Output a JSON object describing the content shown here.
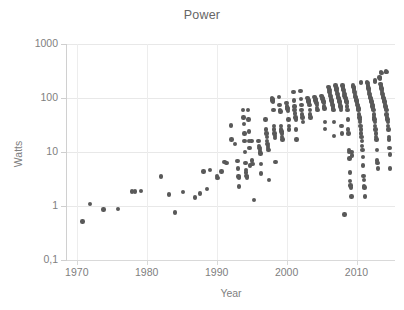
{
  "chart_data": {
    "type": "scatter",
    "title": "Power",
    "xlabel": "Year",
    "ylabel": "Watts",
    "xlim": [
      1968.6,
      2015.5
    ],
    "ylim": [
      0.1,
      1000
    ],
    "yscale": "log",
    "xticks": [
      1970,
      1980,
      1990,
      2000,
      2010
    ],
    "xticklabels": [
      "1970",
      "1980",
      "1990",
      "2000",
      "2010"
    ],
    "yticks": [
      0.1,
      1,
      10,
      100,
      1000
    ],
    "yticklabels": [
      "0,1",
      "1",
      "10",
      "100",
      "1000"
    ],
    "grid": "both",
    "legend": "none",
    "marker_color": "#595959",
    "marker_size_px": 4.4,
    "axis_color": "#d4d4d4",
    "grid_color": "#e8e8e8",
    "text_color": "#808080",
    "title_color": "#666666",
    "background": "#ffffff",
    "points": [
      [
        1970.8,
        0.52
      ],
      [
        1971.9,
        1.08
      ],
      [
        1973.8,
        0.87
      ],
      [
        1975.9,
        0.88
      ],
      [
        1977.9,
        1.85
      ],
      [
        1978.3,
        1.85
      ],
      [
        1979.2,
        1.9
      ],
      [
        1982.0,
        3.5
      ],
      [
        1983.2,
        1.65
      ],
      [
        1984.0,
        0.76
      ],
      [
        1985.2,
        1.8
      ],
      [
        1986.9,
        1.45
      ],
      [
        1987.6,
        1.7
      ],
      [
        1988.1,
        4.4
      ],
      [
        1988.6,
        2.05
      ],
      [
        1989.0,
        4.7
      ],
      [
        1990.0,
        3.6
      ],
      [
        1990.1,
        3.3
      ],
      [
        1990.7,
        4.4
      ],
      [
        1991.1,
        6.5
      ],
      [
        1991.4,
        6.3
      ],
      [
        1992.0,
        31
      ],
      [
        1992.1,
        17
      ],
      [
        1992.6,
        14
      ],
      [
        1993.0,
        6.9
      ],
      [
        1993.05,
        5.0
      ],
      [
        1993.1,
        3.5
      ],
      [
        1993.15,
        3.4
      ],
      [
        1993.2,
        2.3
      ],
      [
        1993.8,
        60
      ],
      [
        1993.85,
        44
      ],
      [
        1993.9,
        33
      ],
      [
        1993.95,
        22
      ],
      [
        1994.0,
        16
      ],
      [
        1994.05,
        10
      ],
      [
        1994.1,
        6.3
      ],
      [
        1994.15,
        4.6
      ],
      [
        1994.2,
        4.2
      ],
      [
        1994.25,
        3.6
      ],
      [
        1994.3,
        3.4
      ],
      [
        1994.5,
        60
      ],
      [
        1994.55,
        40
      ],
      [
        1994.6,
        24
      ],
      [
        1994.65,
        16
      ],
      [
        1994.7,
        12
      ],
      [
        1994.75,
        5.6
      ],
      [
        1995.0,
        16
      ],
      [
        1995.05,
        7.0
      ],
      [
        1995.1,
        6.0
      ],
      [
        1995.3,
        1.28
      ],
      [
        1996.0,
        16
      ],
      [
        1996.05,
        13
      ],
      [
        1996.1,
        12
      ],
      [
        1996.15,
        11
      ],
      [
        1996.2,
        10
      ],
      [
        1996.25,
        9.4
      ],
      [
        1996.3,
        6.0
      ],
      [
        1996.35,
        4.0
      ],
      [
        1997.0,
        40
      ],
      [
        1997.05,
        26
      ],
      [
        1997.1,
        22
      ],
      [
        1997.15,
        19
      ],
      [
        1997.2,
        16
      ],
      [
        1997.25,
        14
      ],
      [
        1997.3,
        13
      ],
      [
        1997.35,
        12
      ],
      [
        1997.4,
        11
      ],
      [
        1997.45,
        3.0
      ],
      [
        1997.9,
        100
      ],
      [
        1997.95,
        96
      ],
      [
        1998.0,
        90
      ],
      [
        1998.05,
        86
      ],
      [
        1998.1,
        60
      ],
      [
        1998.15,
        30
      ],
      [
        1998.2,
        26
      ],
      [
        1998.25,
        22
      ],
      [
        1998.3,
        20
      ],
      [
        1998.35,
        18
      ],
      [
        1998.4,
        6.5
      ],
      [
        1998.9,
        104
      ],
      [
        1999.0,
        74
      ],
      [
        1999.05,
        60
      ],
      [
        1999.1,
        56
      ],
      [
        1999.15,
        30
      ],
      [
        1999.2,
        26
      ],
      [
        1999.25,
        24
      ],
      [
        1999.3,
        22
      ],
      [
        1999.35,
        19
      ],
      [
        1999.4,
        17
      ],
      [
        2000.0,
        80
      ],
      [
        2000.05,
        70
      ],
      [
        2000.1,
        66
      ],
      [
        2000.15,
        62
      ],
      [
        2000.2,
        58
      ],
      [
        2000.25,
        40
      ],
      [
        2000.3,
        30
      ],
      [
        2000.35,
        26
      ],
      [
        2001.0,
        130
      ],
      [
        2001.05,
        90
      ],
      [
        2001.1,
        70
      ],
      [
        2001.15,
        60
      ],
      [
        2001.2,
        52
      ],
      [
        2001.25,
        44
      ],
      [
        2001.3,
        40
      ],
      [
        2001.35,
        26
      ],
      [
        2001.4,
        17
      ],
      [
        2002.0,
        134
      ],
      [
        2002.05,
        96
      ],
      [
        2002.1,
        74
      ],
      [
        2002.15,
        60
      ],
      [
        2002.2,
        50
      ],
      [
        2002.25,
        44
      ],
      [
        2002.3,
        36
      ],
      [
        2003.0,
        100
      ],
      [
        2003.05,
        96
      ],
      [
        2003.1,
        90
      ],
      [
        2003.15,
        86
      ],
      [
        2003.2,
        80
      ],
      [
        2003.25,
        74
      ],
      [
        2003.3,
        60
      ],
      [
        2003.35,
        50
      ],
      [
        2003.4,
        44
      ],
      [
        2004.0,
        104
      ],
      [
        2004.05,
        100
      ],
      [
        2004.1,
        96
      ],
      [
        2004.15,
        90
      ],
      [
        2004.2,
        86
      ],
      [
        2004.25,
        80
      ],
      [
        2004.3,
        74
      ],
      [
        2004.35,
        66
      ],
      [
        2004.4,
        60
      ],
      [
        2005.0,
        110
      ],
      [
        2005.05,
        104
      ],
      [
        2005.1,
        100
      ],
      [
        2005.15,
        96
      ],
      [
        2005.2,
        90
      ],
      [
        2005.25,
        86
      ],
      [
        2005.3,
        80
      ],
      [
        2005.35,
        70
      ],
      [
        2005.4,
        64
      ],
      [
        2005.45,
        27
      ],
      [
        2006.0,
        160
      ],
      [
        2006.05,
        150
      ],
      [
        2006.1,
        140
      ],
      [
        2006.15,
        130
      ],
      [
        2006.2,
        120
      ],
      [
        2006.25,
        110
      ],
      [
        2006.3,
        100
      ],
      [
        2006.35,
        96
      ],
      [
        2006.4,
        90
      ],
      [
        2006.45,
        86
      ],
      [
        2006.5,
        80
      ],
      [
        2006.55,
        74
      ],
      [
        2006.6,
        70
      ],
      [
        2006.65,
        64
      ],
      [
        2006.7,
        60
      ],
      [
        2006.75,
        36
      ],
      [
        2006.8,
        20
      ],
      [
        2007.0,
        170
      ],
      [
        2007.05,
        160
      ],
      [
        2007.1,
        150
      ],
      [
        2007.15,
        140
      ],
      [
        2007.2,
        130
      ],
      [
        2007.25,
        120
      ],
      [
        2007.3,
        110
      ],
      [
        2007.35,
        104
      ],
      [
        2007.4,
        100
      ],
      [
        2007.45,
        96
      ],
      [
        2007.5,
        90
      ],
      [
        2007.55,
        86
      ],
      [
        2007.6,
        80
      ],
      [
        2007.65,
        74
      ],
      [
        2007.7,
        70
      ],
      [
        2007.75,
        66
      ],
      [
        2007.8,
        60
      ],
      [
        2007.85,
        30
      ],
      [
        2007.9,
        22
      ],
      [
        2008.0,
        170
      ],
      [
        2008.05,
        160
      ],
      [
        2008.1,
        150
      ],
      [
        2008.15,
        140
      ],
      [
        2008.2,
        130
      ],
      [
        2008.25,
        120
      ],
      [
        2008.3,
        110
      ],
      [
        2008.35,
        104
      ],
      [
        2008.4,
        100
      ],
      [
        2008.45,
        96
      ],
      [
        2008.5,
        90
      ],
      [
        2008.55,
        86
      ],
      [
        2008.6,
        80
      ],
      [
        2008.65,
        70
      ],
      [
        2008.7,
        60
      ],
      [
        2008.75,
        40
      ],
      [
        2008.8,
        26
      ],
      [
        2008.85,
        22
      ],
      [
        2008.9,
        11
      ],
      [
        2008.95,
        10
      ],
      [
        2009.0,
        7.6
      ],
      [
        2009.05,
        4.2
      ],
      [
        2009.1,
        2.9
      ],
      [
        2009.15,
        2.4
      ],
      [
        2009.2,
        2.2
      ],
      [
        2009.25,
        1.5
      ],
      [
        2008.3,
        0.7
      ],
      [
        2009.5,
        170
      ],
      [
        2009.55,
        160
      ],
      [
        2009.6,
        150
      ],
      [
        2009.65,
        140
      ],
      [
        2009.7,
        130
      ],
      [
        2009.75,
        120
      ],
      [
        2009.8,
        110
      ],
      [
        2009.85,
        104
      ],
      [
        2009.9,
        100
      ],
      [
        2009.95,
        96
      ],
      [
        2010.0,
        90
      ],
      [
        2010.05,
        86
      ],
      [
        2010.1,
        80
      ],
      [
        2010.15,
        74
      ],
      [
        2010.2,
        70
      ],
      [
        2010.25,
        64
      ],
      [
        2010.3,
        60
      ],
      [
        2010.35,
        50
      ],
      [
        2010.4,
        44
      ],
      [
        2010.45,
        40
      ],
      [
        2010.5,
        36
      ],
      [
        2010.55,
        30
      ],
      [
        2010.6,
        26
      ],
      [
        2010.65,
        22
      ],
      [
        2010.7,
        19
      ],
      [
        2010.75,
        16
      ],
      [
        2010.8,
        13
      ],
      [
        2010.85,
        11
      ],
      [
        2010.9,
        8.0
      ],
      [
        2010.95,
        5.6
      ],
      [
        2011.0,
        3.6
      ],
      [
        2011.05,
        3.0
      ],
      [
        2011.1,
        2.3
      ],
      [
        2011.15,
        2.2
      ],
      [
        2011.2,
        1.5
      ],
      [
        2011.5,
        200
      ],
      [
        2011.55,
        190
      ],
      [
        2011.6,
        170
      ],
      [
        2011.65,
        160
      ],
      [
        2011.7,
        150
      ],
      [
        2011.75,
        140
      ],
      [
        2011.8,
        130
      ],
      [
        2011.85,
        120
      ],
      [
        2011.9,
        110
      ],
      [
        2011.95,
        104
      ],
      [
        2012.0,
        100
      ],
      [
        2012.05,
        96
      ],
      [
        2012.1,
        90
      ],
      [
        2012.15,
        86
      ],
      [
        2012.2,
        80
      ],
      [
        2012.25,
        74
      ],
      [
        2012.3,
        70
      ],
      [
        2012.35,
        64
      ],
      [
        2012.4,
        60
      ],
      [
        2012.45,
        50
      ],
      [
        2012.5,
        44
      ],
      [
        2012.55,
        40
      ],
      [
        2012.6,
        36
      ],
      [
        2012.65,
        30
      ],
      [
        2012.7,
        26
      ],
      [
        2012.75,
        22
      ],
      [
        2012.8,
        19
      ],
      [
        2012.85,
        17
      ],
      [
        2012.9,
        11
      ],
      [
        2012.95,
        7.0
      ],
      [
        2013.0,
        6.2
      ],
      [
        2013.05,
        5.0
      ],
      [
        2013.3,
        240
      ],
      [
        2013.35,
        230
      ],
      [
        2013.4,
        180
      ],
      [
        2013.45,
        170
      ],
      [
        2013.5,
        160
      ],
      [
        2013.55,
        150
      ],
      [
        2013.6,
        140
      ],
      [
        2013.65,
        130
      ],
      [
        2013.7,
        120
      ],
      [
        2013.75,
        110
      ],
      [
        2013.8,
        104
      ],
      [
        2013.85,
        100
      ],
      [
        2013.9,
        96
      ],
      [
        2013.95,
        90
      ],
      [
        2014.0,
        86
      ],
      [
        2014.05,
        80
      ],
      [
        2014.1,
        74
      ],
      [
        2014.15,
        70
      ],
      [
        2014.2,
        64
      ],
      [
        2014.25,
        60
      ],
      [
        2014.3,
        50
      ],
      [
        2014.35,
        44
      ],
      [
        2014.4,
        40
      ],
      [
        2014.45,
        36
      ],
      [
        2014.5,
        30
      ],
      [
        2014.55,
        26
      ],
      [
        2014.6,
        19
      ],
      [
        2014.65,
        17
      ],
      [
        2014.7,
        12
      ],
      [
        2014.75,
        9.0
      ],
      [
        2014.8,
        5.0
      ],
      [
        2014.2,
        310
      ],
      [
        2014.25,
        300
      ],
      [
        2013.5,
        300
      ],
      [
        2013.55,
        290
      ],
      [
        2012.6,
        210
      ],
      [
        2012.65,
        200
      ],
      [
        2010.6,
        200
      ],
      [
        2010.65,
        190
      ],
      [
        2005.5,
        36
      ],
      [
        2009.3,
        10
      ],
      [
        2009.35,
        8.6
      ]
    ]
  }
}
